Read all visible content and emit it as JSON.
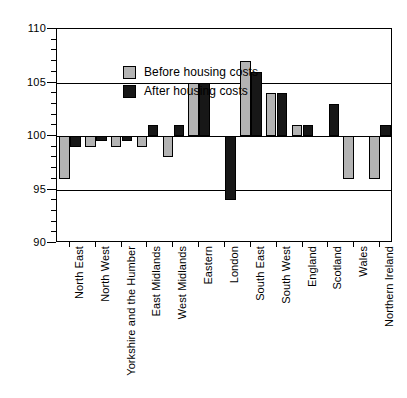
{
  "chart_data": {
    "type": "bar",
    "title": "",
    "subtitle": "",
    "xlabel": "",
    "ylabel": "",
    "ylim": [
      90,
      110
    ],
    "ytick_labels": [
      "90",
      "95",
      "100",
      "105",
      "110"
    ],
    "ytick_values": [
      90,
      95,
      100,
      105,
      110
    ],
    "yminor_step": 1,
    "grid": "horizontal-major",
    "baseline": 100,
    "legend_position": "top-left-inside",
    "categories": [
      "North East",
      "North West",
      "Yorkshire and the Humber",
      "East Midlands",
      "West Midlands",
      "Eastern",
      "London",
      "South East",
      "South West",
      "England",
      "Scotland",
      "Wales",
      "Northern Ireland"
    ],
    "series": [
      {
        "name": "Before housing costs",
        "color": "#b3b3b3",
        "values": [
          96,
          99,
          99,
          99,
          98,
          105,
          100,
          107,
          104,
          101,
          100,
          96,
          96
        ]
      },
      {
        "name": "After housing costs",
        "color": "#171717",
        "values": [
          99,
          99.5,
          99.5,
          101,
          101,
          105,
          94,
          106,
          104,
          101,
          103,
          100,
          101
        ]
      }
    ]
  },
  "legend": {
    "items": [
      {
        "label": "Before housing costs",
        "key": "before"
      },
      {
        "label": "After housing costs",
        "key": "after"
      }
    ]
  }
}
